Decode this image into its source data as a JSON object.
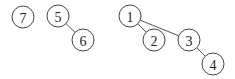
{
  "diagram": {
    "type": "forest",
    "node_radius": 11,
    "colors": {
      "stroke": "#444444",
      "fill": "#ffffff",
      "text": "#222222"
    },
    "nodes": [
      {
        "id": "7",
        "label": "7",
        "x": 23,
        "y": 17
      },
      {
        "id": "5",
        "label": "5",
        "x": 58,
        "y": 16
      },
      {
        "id": "6",
        "label": "6",
        "x": 83,
        "y": 40
      },
      {
        "id": "1",
        "label": "1",
        "x": 130,
        "y": 16
      },
      {
        "id": "2",
        "label": "2",
        "x": 154,
        "y": 40
      },
      {
        "id": "3",
        "label": "3",
        "x": 189,
        "y": 40
      },
      {
        "id": "4",
        "label": "4",
        "x": 213,
        "y": 64
      }
    ],
    "edges": [
      {
        "from": "5",
        "to": "6"
      },
      {
        "from": "1",
        "to": "2"
      },
      {
        "from": "1",
        "to": "3"
      },
      {
        "from": "3",
        "to": "4"
      }
    ]
  }
}
